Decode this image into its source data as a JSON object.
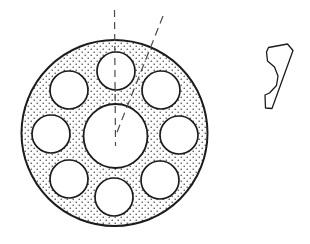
{
  "figure": {
    "type": "engineering-drawing",
    "background_color": "#ffffff",
    "line_color": "#1c1c1c",
    "fill_pattern": "stipple-dots",
    "fill_dot_color": "#3a3a3a",
    "fill_background_color": "#fdfdfd",
    "centerline_color": "#4a4a4a",
    "canvas": {
      "width": 310,
      "height": 244
    }
  },
  "disc": {
    "name": "perforated-disc",
    "center_x": 114.5,
    "center_y": 133,
    "outer_radius": 93,
    "outer_stroke_width": 2.0,
    "filled": true
  },
  "center_bore": {
    "name": "center-bore",
    "center_x": 115.5,
    "center_y": 136,
    "radius": 32,
    "stroke_width": 1.8,
    "fill": "#ffffff"
  },
  "bolt_circle": {
    "name": "bolt-hole-pattern",
    "hole_count": 8,
    "hole_radius": 19,
    "pitch_radius": 63,
    "start_angle_deg": -90,
    "angle_step_deg": 45,
    "stroke_width": 1.7,
    "holes": [
      {
        "label": "hole-1",
        "cx": 116,
        "cy": 71
      },
      {
        "label": "hole-2",
        "cx": 161,
        "cy": 90
      },
      {
        "label": "hole-3",
        "cx": 179,
        "cy": 135
      },
      {
        "label": "hole-4",
        "cx": 160,
        "cy": 180
      },
      {
        "label": "hole-5",
        "cx": 114,
        "cy": 197
      },
      {
        "label": "hole-6",
        "cx": 69,
        "cy": 179
      },
      {
        "label": "hole-7",
        "cx": 51,
        "cy": 134
      },
      {
        "label": "hole-8",
        "cx": 69,
        "cy": 90
      }
    ]
  },
  "centerlines": [
    {
      "label": "vertical-centerline",
      "x1": 114.5,
      "y1": 10,
      "x2": 115.5,
      "y2": 146,
      "dash": "7 5",
      "stroke_width": 1.2
    },
    {
      "label": "angled-centerline",
      "x1": 163,
      "y1": 16,
      "x2": 115.5,
      "y2": 136,
      "dash": "8 5",
      "stroke_width": 1.2,
      "angle_from_vertical_deg": 21.6
    }
  ],
  "segment_detail": {
    "name": "disc-segment-detail",
    "description": "single repeating wedge segment with concave notch",
    "stroke_width": 1.3,
    "fill": "none",
    "outline_path": "M 268.5 47.5 L 287.5 44.0 L 293.0 50.5 L 272.0 108.5 L 265.5 108.0 L 265.0 95.0 L 269.5 93.0 L 276.5 85.5 L 278.0 76.0 L 274.5 67.0 L 267.5 61.0 L 266.5 52.0 Z"
  }
}
